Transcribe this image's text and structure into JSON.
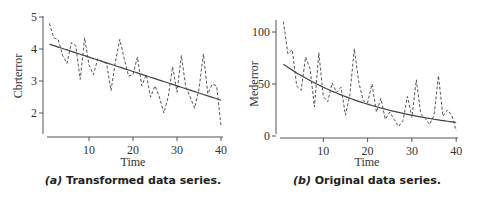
{
  "chart_data": [
    {
      "type": "line",
      "title": "(a) Transformed data series.",
      "caption_prefix": "(a)",
      "caption_text": "Transformed data series.",
      "xlabel": "Time",
      "ylabel": "Cbrterror",
      "xlim": [
        0,
        40.5
      ],
      "ylim": [
        1.3,
        5
      ],
      "xticks": [
        10,
        20,
        30,
        40
      ],
      "yticks": [
        2,
        3,
        4,
        5
      ],
      "grid": false,
      "legend": "none",
      "x": [
        1,
        2,
        3,
        4,
        5,
        6,
        7,
        8,
        9,
        10,
        11,
        12,
        13,
        14,
        15,
        16,
        17,
        18,
        19,
        20,
        21,
        22,
        23,
        24,
        25,
        26,
        27,
        28,
        29,
        30,
        31,
        32,
        33,
        34,
        35,
        36,
        37,
        38,
        39,
        40
      ],
      "series": [
        {
          "name": "observed",
          "style": "dashed",
          "values": [
            4.8,
            4.35,
            4.3,
            3.8,
            3.55,
            4.2,
            4.1,
            3.05,
            4.35,
            3.5,
            3.2,
            3.7,
            3.6,
            3.55,
            2.7,
            3.6,
            4.3,
            3.7,
            3.15,
            3.2,
            3.75,
            2.85,
            3.2,
            2.5,
            2.85,
            2.5,
            2.0,
            2.5,
            3.45,
            2.65,
            3.8,
            2.8,
            2.5,
            2.15,
            2.75,
            3.85,
            2.6,
            2.9,
            2.85,
            1.6
          ]
        },
        {
          "name": "fitted trend",
          "style": "solid",
          "shape": "linear",
          "values_at": {
            "1": 4.15,
            "40": 2.4
          }
        }
      ]
    },
    {
      "type": "line",
      "title": "(b) Original data series.",
      "caption_prefix": "(b)",
      "caption_text": "Original data series.",
      "xlabel": "Time",
      "ylabel": "Mederror",
      "xlim": [
        0,
        40.5
      ],
      "ylim": [
        0,
        112
      ],
      "xticks": [
        10,
        20,
        30,
        40
      ],
      "yticks": [
        0,
        50,
        100
      ],
      "grid": false,
      "legend": "none",
      "x": [
        1,
        2,
        3,
        4,
        5,
        6,
        7,
        8,
        9,
        10,
        11,
        12,
        13,
        14,
        15,
        16,
        17,
        18,
        19,
        20,
        21,
        22,
        23,
        24,
        25,
        26,
        27,
        28,
        29,
        30,
        31,
        32,
        33,
        34,
        35,
        36,
        37,
        38,
        39,
        40
      ],
      "series": [
        {
          "name": "observed",
          "style": "dashed",
          "values": [
            110,
            79,
            83,
            48,
            44,
            76,
            65,
            28,
            80,
            38,
            33,
            51,
            42,
            47,
            20,
            40,
            84,
            52,
            34,
            32,
            50,
            23,
            36,
            16,
            23,
            16,
            9,
            15,
            38,
            18,
            54,
            21,
            17,
            11,
            20,
            58,
            19,
            25,
            20,
            5
          ]
        },
        {
          "name": "fitted trend",
          "style": "solid",
          "shape": "exponential-decay",
          "values_at": {
            "1": 69,
            "40": 13
          }
        }
      ]
    }
  ]
}
